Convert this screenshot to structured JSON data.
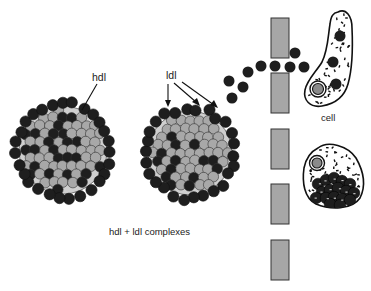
{
  "labels": {
    "hdl": "hdl",
    "ldl": "ldl",
    "cell": "cell",
    "complexes": "hdl + ldl complexes"
  },
  "colors": {
    "dark_particle": "#1e1e1e",
    "light_particle": "#a8a8a8",
    "barrier": "#a6a6a6",
    "cell_outline": "#111111",
    "background": "#ffffff"
  },
  "elements": {
    "complexes": [
      {
        "name": "hdl-complex",
        "cx": 63,
        "cy": 150,
        "r": 50
      },
      {
        "name": "ldl-complex",
        "cx": 190,
        "cy": 153,
        "r": 48
      }
    ],
    "barrier_segments": [
      {
        "x": 271,
        "y": 18,
        "w": 18,
        "h": 40
      },
      {
        "x": 271,
        "y": 73,
        "w": 18,
        "h": 40
      },
      {
        "x": 271,
        "y": 129,
        "w": 18,
        "h": 40
      },
      {
        "x": 271,
        "y": 184,
        "w": 18,
        "h": 40
      },
      {
        "x": 271,
        "y": 240,
        "w": 18,
        "h": 40
      }
    ],
    "free_particles": [
      {
        "cx": 229,
        "cy": 81
      },
      {
        "cx": 243,
        "cy": 87
      },
      {
        "cx": 232,
        "cy": 98
      },
      {
        "cx": 248,
        "cy": 72
      },
      {
        "cx": 261,
        "cy": 66
      },
      {
        "cx": 275,
        "cy": 66
      },
      {
        "cx": 290,
        "cy": 67
      },
      {
        "cx": 304,
        "cy": 67
      },
      {
        "cx": 295,
        "cy": 53
      }
    ],
    "cells": [
      {
        "name": "upper-cell"
      },
      {
        "name": "lower-cell"
      }
    ]
  }
}
